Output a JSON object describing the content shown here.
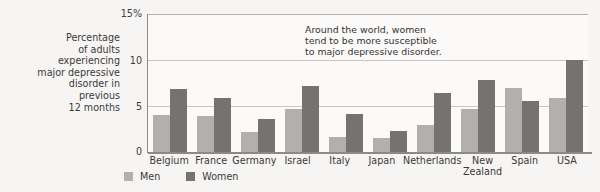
{
  "chart_data": {
    "type": "bar",
    "title": "",
    "xlabel": "",
    "ylabel": "Percentage\nof adults\nexperiencing\nmajor depressive\ndisorder in\nprevious\n12 months",
    "ylim": [
      0,
      15
    ],
    "yticks": [
      "15%",
      "10",
      "5",
      "0"
    ],
    "ytick_values": [
      15,
      10,
      5,
      0
    ],
    "grid": true,
    "legend_position": "bottom-left",
    "categories": [
      "Belgium",
      "France",
      "Germany",
      "Israel",
      "Italy",
      "Japan",
      "Netherlands",
      "New\nZealand",
      "Spain",
      "USA"
    ],
    "series": [
      {
        "name": "Men",
        "color": "#b2b0ad",
        "values": [
          4.0,
          3.9,
          2.2,
          4.7,
          1.6,
          1.5,
          2.9,
          4.7,
          7.0,
          5.9
        ]
      },
      {
        "name": "Women",
        "color": "#75736f",
        "values": [
          6.9,
          5.9,
          3.6,
          7.2,
          4.1,
          2.3,
          6.4,
          7.8,
          5.5,
          10.0
        ]
      }
    ],
    "annotations": [
      {
        "text": "Around the world, women\ntend to be more susceptible\nto major depressive disorder."
      }
    ]
  },
  "legend": {
    "items": [
      {
        "label": "Men",
        "swatch": "men-swatch"
      },
      {
        "label": "Women",
        "swatch": "women-swatch"
      }
    ]
  },
  "colors": {
    "men": "#b2b0ad",
    "women": "#75736f",
    "grid": "#c9c6c2",
    "axis": "#8d8a86",
    "text": "#3a3a3a",
    "background": "#f6f5f3",
    "plot_background": "#fbfaf9"
  }
}
